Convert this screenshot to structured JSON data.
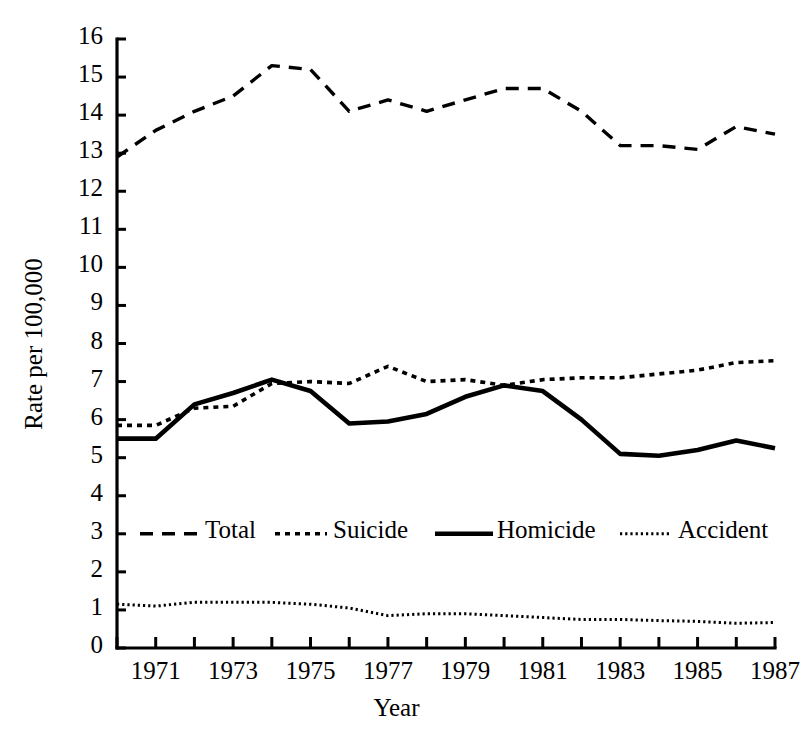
{
  "chart_data": {
    "type": "line",
    "title": "",
    "subtitle": "",
    "xlabel": "Year",
    "ylabel": "Rate per 100,000",
    "xlim": [
      1970,
      1987
    ],
    "ylim": [
      0,
      16
    ],
    "grid": false,
    "legend_position": "inside-lower-center",
    "x": [
      1970,
      1971,
      1972,
      1973,
      1974,
      1975,
      1976,
      1977,
      1978,
      1979,
      1980,
      1981,
      1982,
      1983,
      1984,
      1985,
      1986,
      1987
    ],
    "xticks": [
      1970,
      1971,
      1972,
      1973,
      1974,
      1975,
      1976,
      1977,
      1978,
      1979,
      1980,
      1981,
      1982,
      1983,
      1984,
      1985,
      1986,
      1987
    ],
    "xtick_labels_shown": [
      "1971",
      "1973",
      "1975",
      "1977",
      "1979",
      "1981",
      "1983",
      "1985",
      "1987"
    ],
    "yticks": [
      0,
      1,
      2,
      3,
      4,
      5,
      6,
      7,
      8,
      9,
      10,
      11,
      12,
      13,
      14,
      15,
      16
    ],
    "ytick_labels": [
      "0",
      "1",
      "2",
      "3",
      "4",
      "5",
      "6",
      "7",
      "8",
      "9",
      "10",
      "11",
      "12",
      "13",
      "14",
      "15",
      "16"
    ],
    "series": [
      {
        "name": "Total",
        "style": "dashed",
        "color": "#000000",
        "values": [
          12.9,
          13.6,
          14.1,
          14.5,
          15.3,
          15.2,
          14.1,
          14.4,
          14.1,
          14.4,
          14.7,
          14.7,
          14.1,
          13.2,
          13.2,
          13.1,
          13.7,
          13.5
        ]
      },
      {
        "name": "Suicide",
        "style": "dotted-medium",
        "color": "#000000",
        "values": [
          5.85,
          5.85,
          6.3,
          6.35,
          6.95,
          7.0,
          6.95,
          7.4,
          7.0,
          7.05,
          6.9,
          7.05,
          7.1,
          7.1,
          7.2,
          7.3,
          7.5,
          7.55
        ]
      },
      {
        "name": "Homicide",
        "style": "solid",
        "color": "#000000",
        "values": [
          5.5,
          5.5,
          6.4,
          6.7,
          7.05,
          6.75,
          5.9,
          5.95,
          6.15,
          6.6,
          6.9,
          6.75,
          6.0,
          5.1,
          5.05,
          5.2,
          5.45,
          5.25
        ]
      },
      {
        "name": "Accident",
        "style": "dotted-fine",
        "color": "#000000",
        "values": [
          1.15,
          1.1,
          1.2,
          1.2,
          1.2,
          1.15,
          1.05,
          0.85,
          0.9,
          0.9,
          0.85,
          0.8,
          0.75,
          0.75,
          0.72,
          0.7,
          0.65,
          0.67
        ]
      }
    ],
    "legend": [
      {
        "label": "Total",
        "style": "dashed"
      },
      {
        "label": "Suicide",
        "style": "dotted-medium"
      },
      {
        "label": "Homicide",
        "style": "solid"
      },
      {
        "label": "Accident",
        "style": "dotted-fine"
      }
    ]
  },
  "axis": {
    "ylabel": "Rate per 100,000",
    "xlabel": "Year"
  }
}
